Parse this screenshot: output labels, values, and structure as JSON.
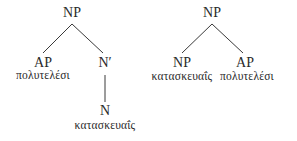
{
  "trees": [
    {
      "name": "left-tree",
      "root": {
        "label": "NP"
      },
      "left_child": {
        "label": "AP",
        "word": "πολυτελέσι"
      },
      "right_child": {
        "label": "N′"
      },
      "right_grandchild": {
        "label": "N",
        "word": "κατασκευαΐς"
      }
    },
    {
      "name": "right-tree",
      "root": {
        "label": "NP"
      },
      "left_child": {
        "label": "NP",
        "word": "κατασκευαΐς"
      },
      "right_child": {
        "label": "AP",
        "word": "πολυτελέσι"
      }
    }
  ],
  "colors": {
    "text": "#2a2a2a",
    "lines": "#3a3a3a",
    "background": "#ffffff"
  }
}
